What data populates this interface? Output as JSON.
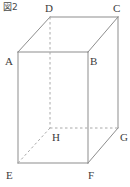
{
  "figure": {
    "caption": "図2",
    "shape_name": "rectangular-prism",
    "canvas": {
      "width": 130,
      "height": 187
    },
    "colors": {
      "background": "#ffffff",
      "edge_solid": "#8d8d8d",
      "edge_hidden": "#a8a8a8",
      "label_text": "#3c3c3c",
      "caption_text": "#4a4a4a"
    },
    "vertices": [
      {
        "name": "A",
        "label": "A",
        "x": 18,
        "y": 52,
        "label_x": 5,
        "label_y": 56,
        "hidden": false
      },
      {
        "name": "B",
        "label": "B",
        "x": 88,
        "y": 52,
        "label_x": 90,
        "label_y": 56,
        "hidden": false
      },
      {
        "name": "C",
        "label": "C",
        "x": 118,
        "y": 17,
        "label_x": 113,
        "label_y": 3,
        "hidden": false
      },
      {
        "name": "D",
        "label": "D",
        "x": 50,
        "y": 17,
        "label_x": 45,
        "label_y": 3,
        "hidden": false
      },
      {
        "name": "E",
        "label": "E",
        "x": 18,
        "y": 163,
        "label_x": 6,
        "label_y": 170,
        "hidden": false
      },
      {
        "name": "F",
        "label": "F",
        "x": 88,
        "y": 163,
        "label_x": 88,
        "label_y": 170,
        "hidden": false
      },
      {
        "name": "G",
        "label": "G",
        "x": 118,
        "y": 128,
        "label_x": 120,
        "label_y": 132,
        "hidden": false
      },
      {
        "name": "H",
        "label": "H",
        "x": 50,
        "y": 128,
        "label_x": 52,
        "label_y": 132,
        "hidden": true
      }
    ],
    "edges_solid": [
      {
        "from": "A",
        "to": "B",
        "x1": 18,
        "y1": 52,
        "x2": 88,
        "y2": 52
      },
      {
        "from": "A",
        "to": "D",
        "x1": 18,
        "y1": 52,
        "x2": 50,
        "y2": 17
      },
      {
        "from": "D",
        "to": "C",
        "x1": 50,
        "y1": 17,
        "x2": 118,
        "y2": 17
      },
      {
        "from": "C",
        "to": "B",
        "x1": 118,
        "y1": 17,
        "x2": 88,
        "y2": 52
      },
      {
        "from": "A",
        "to": "E",
        "x1": 18,
        "y1": 52,
        "x2": 18,
        "y2": 163
      },
      {
        "from": "B",
        "to": "F",
        "x1": 88,
        "y1": 52,
        "x2": 88,
        "y2": 163
      },
      {
        "from": "C",
        "to": "G",
        "x1": 118,
        "y1": 17,
        "x2": 118,
        "y2": 128
      },
      {
        "from": "E",
        "to": "F",
        "x1": 18,
        "y1": 163,
        "x2": 88,
        "y2": 163
      },
      {
        "from": "F",
        "to": "G",
        "x1": 88,
        "y1": 163,
        "x2": 118,
        "y2": 128
      }
    ],
    "edges_hidden": [
      {
        "from": "D",
        "to": "H",
        "x1": 50,
        "y1": 17,
        "x2": 50,
        "y2": 128
      },
      {
        "from": "H",
        "to": "G",
        "x1": 50,
        "y1": 128,
        "x2": 118,
        "y2": 128
      },
      {
        "from": "H",
        "to": "E",
        "x1": 50,
        "y1": 128,
        "x2": 18,
        "y2": 163
      }
    ]
  }
}
